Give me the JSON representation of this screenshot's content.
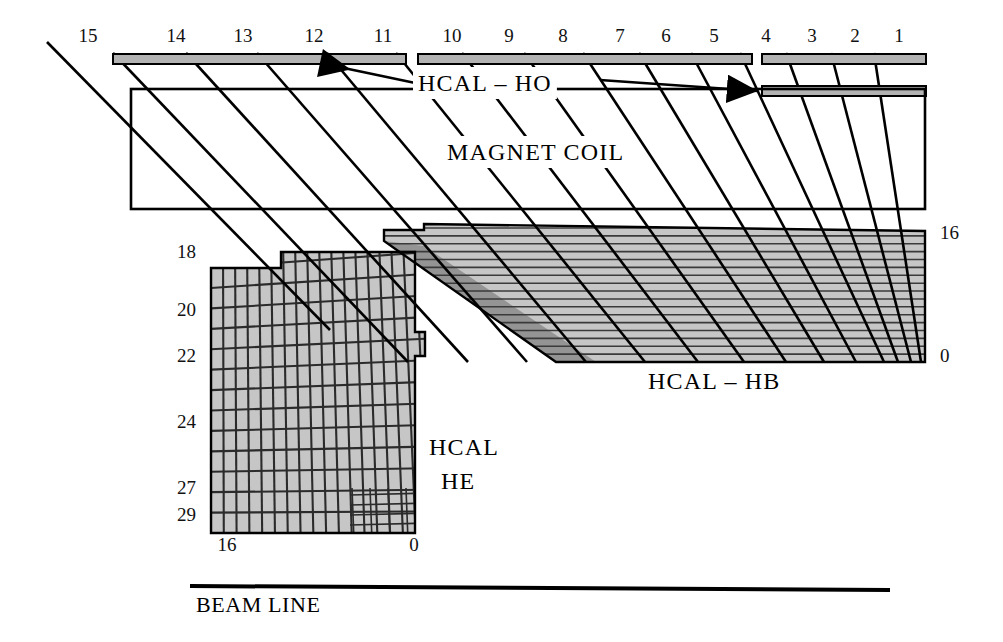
{
  "figure": {
    "kind": "detector-cross-section",
    "background_color": "#ffffff",
    "line_color": "#000000",
    "fill_gray_light": "#c6c6c6",
    "fill_gray_mid": "#b3b3b3",
    "fill_gray_dark": "#949494",
    "fill_white": "#ffffff"
  },
  "labels": {
    "ho": "HCAL – HO",
    "magnet": "MAGNET  COIL",
    "hb": "HCAL – HB",
    "he_line1": "HCAL",
    "he_line2": "HE",
    "beamline": "BEAM LINE"
  },
  "eta_top": {
    "description": "HO / barrel eta tower indices labelled above the top scintillator layers",
    "values": [
      "15",
      "14",
      "13",
      "12",
      "11",
      "10",
      "9",
      "8",
      "7",
      "6",
      "5",
      "4",
      "3",
      "2",
      "1"
    ],
    "x": [
      88,
      176,
      243,
      314,
      383,
      452,
      509,
      563,
      620,
      666,
      714,
      766,
      812,
      855,
      899
    ],
    "y": 42
  },
  "hb_depth_axis": {
    "description": "HB layer-count axis on the right edge",
    "top_value": "16",
    "bottom_value": "0",
    "top_xy": [
      940,
      239
    ],
    "bottom_xy": [
      940,
      362
    ]
  },
  "he_eta_axis": {
    "description": "HE endcap eta tower indices along the left edge",
    "values": [
      "18",
      "20",
      "22",
      "24",
      "27",
      "29"
    ],
    "y": [
      258,
      316,
      362,
      428,
      494,
      521
    ],
    "x": 196
  },
  "he_depth_axis": {
    "description": "HE layer-count axis below the endcap",
    "left_value": "16",
    "right_value": "0",
    "left_xy": [
      227,
      551
    ],
    "right_xy": [
      414,
      551
    ]
  },
  "ho_layers": {
    "description": "Outer hadron calorimeter scintillator slabs drawn as thin grey bars above the magnet coil",
    "bars": [
      {
        "name": "ho-bar-main",
        "x": 113,
        "y": 54,
        "w": 293,
        "h": 10
      },
      {
        "name": "ho-bar-central",
        "x": 418,
        "y": 54,
        "w": 334,
        "h": 10
      },
      {
        "name": "ho-bar-ring4-upper",
        "x": 762,
        "y": 54,
        "w": 164,
        "h": 10
      },
      {
        "name": "ho-bar-ring4-lower",
        "x": 762,
        "y": 86,
        "w": 164,
        "h": 10
      }
    ]
  },
  "magnet_coil": {
    "description": "Open rectangle outline of the solenoid cryostat",
    "x": 131,
    "y": 89,
    "w": 794,
    "h": 120
  },
  "hb_region": {
    "description": "Hadron barrel wedge: horizontal absorber/scintillator layer lines plus radial eta tower boundaries",
    "n_layer_lines": 17,
    "top_y": 228,
    "bottom_y": 362,
    "right_x": 925
  },
  "he_region": {
    "description": "Hadron endcap: grid of near-vertical eta segment boundaries and tilted layer lines",
    "n_columns": 17,
    "n_rows": 13
  },
  "beam_line": {
    "x1": 190,
    "x2": 890,
    "y": 586,
    "text_xy": [
      196,
      612
    ]
  }
}
